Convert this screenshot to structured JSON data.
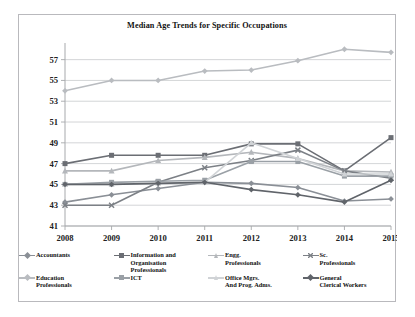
{
  "chart_data": {
    "type": "line",
    "title": "Median Age Trends for Specific Occupations",
    "xlabel": "",
    "ylabel": "",
    "x": [
      2008,
      2009,
      2010,
      2011,
      2012,
      2013,
      2014,
      2015
    ],
    "categories": [
      "2008",
      "2009",
      "2010",
      "2011",
      "2012",
      "2013",
      "2014",
      "2015"
    ],
    "yticks": [
      41,
      43,
      45,
      47,
      49,
      51,
      53,
      55,
      57
    ],
    "ylim": [
      41,
      58.6
    ],
    "grid": true,
    "legend_position": "bottom",
    "series": [
      {
        "name": "Accountants",
        "label": "Accountants",
        "color": "#8a8f96",
        "marker": "diamond",
        "values": [
          43.3,
          44.0,
          44.6,
          45.2,
          45.1,
          44.7,
          43.4,
          43.6
        ]
      },
      {
        "name": "Information and Organisation Professionals",
        "label": "Information and\nOrganisation\nProfessionals",
        "color": "#6b6e74",
        "marker": "square",
        "values": [
          47.0,
          47.8,
          47.8,
          47.8,
          48.9,
          48.9,
          46.3,
          49.5
        ]
      },
      {
        "name": "Engg. Professionals",
        "label": "Engg.\nProfessionals",
        "color": "#b4b7bb",
        "marker": "triangle",
        "values": [
          46.3,
          46.3,
          47.3,
          47.6,
          48.1,
          47.5,
          46.3,
          46.2
        ]
      },
      {
        "name": "Sc. Professionals",
        "label": "Sc.\nProfessionals",
        "color": "#7c8086",
        "marker": "cross",
        "values": [
          43.0,
          43.0,
          45.2,
          46.6,
          47.3,
          48.3,
          46.3,
          45.6
        ]
      },
      {
        "name": "Education Professionals",
        "label": "Education\nProfessionals",
        "color": "#b9bcc0",
        "marker": "diamond",
        "values": [
          54.0,
          55.0,
          55.0,
          55.9,
          56.0,
          56.9,
          58.0,
          57.7
        ]
      },
      {
        "name": "ICT",
        "label": "ICT",
        "color": "#9aa0a6",
        "marker": "square",
        "values": [
          45.0,
          45.2,
          45.3,
          45.4,
          47.2,
          47.2,
          45.8,
          45.8
        ]
      },
      {
        "name": "Office Mgrs. And Prog. Adms.",
        "label": "Office Mgrs.\nAnd Prog. Adms.",
        "color": "#d0d3d6",
        "marker": "triangle",
        "values": [
          45.0,
          45.0,
          45.1,
          45.2,
          49.0,
          47.5,
          46.0,
          46.0
        ]
      },
      {
        "name": "General Clerical Workers",
        "label": "General\nClerical Workers",
        "color": "#60646a",
        "marker": "diamond",
        "values": [
          45.0,
          45.0,
          45.1,
          45.2,
          44.5,
          44.0,
          43.3,
          45.4
        ]
      }
    ]
  },
  "legend": {
    "rows": [
      [
        0,
        1,
        2,
        3
      ],
      [
        4,
        5,
        6,
        7
      ]
    ]
  },
  "axis_color": "#a7a9ac",
  "grid_color": "#c8cacd",
  "border_color": "#b9b9bd"
}
